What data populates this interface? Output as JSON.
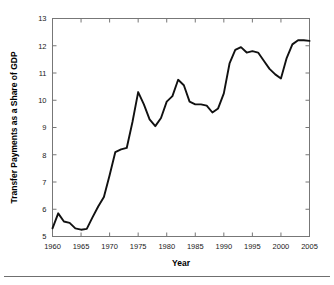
{
  "figure": {
    "background": "#ffffff",
    "line_color": "#111111",
    "axis_color": "#777777",
    "tick_text_color": "#1a1a1a",
    "has_bottom_rule": true
  },
  "chart_data": {
    "type": "line",
    "title": "",
    "xlabel": "Year",
    "ylabel": "Transfer Payments as a Share of GDP",
    "xlim": [
      1960,
      2005
    ],
    "ylim": [
      5,
      13
    ],
    "xticks": [
      1960,
      1965,
      1970,
      1975,
      1980,
      1985,
      1990,
      1995,
      2000,
      2005
    ],
    "xticklabels": [
      "1960",
      "1965",
      "1970",
      "1975",
      "1980",
      "1985",
      "1990",
      "1995",
      "2000",
      "2005"
    ],
    "yticks": [
      5,
      6,
      7,
      8,
      9,
      10,
      11,
      12,
      13
    ],
    "yticklabels": [
      "5",
      "6",
      "7",
      "8",
      "9",
      "10",
      "11",
      "12",
      "13"
    ],
    "grid": false,
    "legend": null,
    "tick_direction": "in",
    "series": [
      {
        "name": "Transfer Payments as a Share of GDP",
        "x": [
          1960,
          1961,
          1962,
          1963,
          1964,
          1965,
          1966,
          1967,
          1968,
          1969,
          1970,
          1971,
          1972,
          1973,
          1974,
          1975,
          1976,
          1977,
          1978,
          1979,
          1980,
          1981,
          1982,
          1983,
          1984,
          1985,
          1986,
          1987,
          1988,
          1989,
          1990,
          1991,
          1992,
          1993,
          1994,
          1995,
          1996,
          1997,
          1998,
          1999,
          2000,
          2001,
          2002,
          2003,
          2004,
          2005
        ],
        "values": [
          5.3,
          5.85,
          5.55,
          5.5,
          5.3,
          5.25,
          5.28,
          5.7,
          6.1,
          6.45,
          7.25,
          8.1,
          8.2,
          8.25,
          9.2,
          10.3,
          9.85,
          9.3,
          9.05,
          9.35,
          9.95,
          10.15,
          10.75,
          10.55,
          9.95,
          9.85,
          9.85,
          9.8,
          9.55,
          9.7,
          10.25,
          11.35,
          11.85,
          11.95,
          11.75,
          11.8,
          11.75,
          11.45,
          11.15,
          10.95,
          10.8,
          11.55,
          12.05,
          12.2,
          12.2,
          12.18
        ]
      }
    ]
  }
}
